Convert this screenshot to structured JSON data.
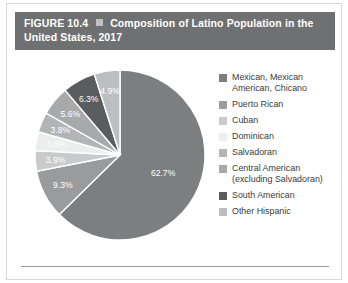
{
  "figure": {
    "number": "FIGURE 10.4",
    "separator_icon": "square-bullet-icon",
    "title": "Composition of Latino Population in the United States, 2017",
    "title_line1": "Composition of Latino Population in",
    "title_line2": "the United States, 2017",
    "header_bg": "#6f7072",
    "header_text_color": "#ffffff"
  },
  "chart_data": {
    "type": "pie",
    "title": "Composition of Latino Population in the United States, 2017",
    "xlabel": "",
    "ylabel": "",
    "legend_position": "right",
    "grid": false,
    "units": "percent",
    "start_angle_deg": 0,
    "direction": "clockwise",
    "categories": [
      "Mexican, Mexican American, Chicano",
      "Puerto Rican",
      "Cuban",
      "Dominican",
      "Salvadoran",
      "Central American (excluding Salvadoran)",
      "South American",
      "Other Hispanic"
    ],
    "values": [
      62.7,
      9.3,
      3.9,
      3.6,
      3.8,
      5.6,
      6.3,
      4.9
    ],
    "labels": [
      "62.7%",
      "9.3%",
      "3.9%",
      "3.6%",
      "3.8%",
      "5.6%",
      "6.3%",
      "4.9%"
    ],
    "colors": [
      "#7d7e80",
      "#9a9b9d",
      "#c9cacb",
      "#eceded",
      "#b3b4b6",
      "#a8a9ab",
      "#5b5c5e",
      "#bdbec0"
    ]
  },
  "legend": {
    "items": [
      {
        "label": "Mexican, Mexican\nAmerican, Chicano",
        "color": "#7d7e80",
        "value": "62.7%"
      },
      {
        "label": "Puerto Rican",
        "color": "#9a9b9d",
        "value": "9.3%"
      },
      {
        "label": "Cuban",
        "color": "#c9cacb",
        "value": "3.9%"
      },
      {
        "label": "Dominican",
        "color": "#eceded",
        "value": "3.6%"
      },
      {
        "label": "Salvadoran",
        "color": "#b3b4b6",
        "value": "3.8%"
      },
      {
        "label": "Central American\n(excluding Salvadoran)",
        "color": "#a8a9ab",
        "value": "5.6%"
      },
      {
        "label": "South American",
        "color": "#5b5c5e",
        "value": "6.3%"
      },
      {
        "label": "Other Hispanic",
        "color": "#bdbec0",
        "value": "4.9%"
      }
    ]
  }
}
